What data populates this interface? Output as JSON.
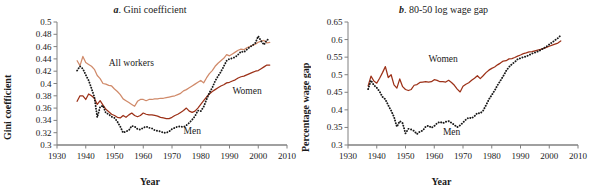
{
  "figure": {
    "width": 591,
    "height": 195,
    "background": "#ffffff"
  },
  "colors": {
    "all_workers": "#D08A6A",
    "women": "#9C3118",
    "men": "#1a1a1a",
    "axis": "#808080",
    "text": "#1a1a1a"
  },
  "panels": {
    "a": {
      "title_letter": "a",
      "title_text": ". Gini coefficient",
      "ylabel": "Gini coefficient",
      "xlabel": "Year"
    },
    "b": {
      "title_letter": "b",
      "title_text": ". 80-50 log wage gap",
      "ylabel": "Percentage wage gap",
      "xlabel": "Year"
    }
  },
  "chart_data": [
    {
      "type": "line",
      "id": "panel-a",
      "title": "a. Gini coefficient",
      "xlabel": "Year",
      "ylabel": "Gini coefficient",
      "xlim": [
        1930,
        2010
      ],
      "ylim": [
        0.3,
        0.5
      ],
      "xticks": [
        1930,
        1940,
        1950,
        1960,
        1970,
        1980,
        1990,
        2000,
        2010
      ],
      "yticks": [
        0.3,
        0.32,
        0.34,
        0.36,
        0.38,
        0.4,
        0.42,
        0.44,
        0.46,
        0.48,
        0.5
      ],
      "ytick_labels": [
        "0.3",
        "0.32",
        "0.34",
        "0.36",
        "0.38",
        "0.4",
        "0.42",
        "0.44",
        "0.46",
        "0.48",
        "0.5"
      ],
      "grid": false,
      "legend": "inline-annotations",
      "annotations": [
        {
          "text": "All workers",
          "x": 1948,
          "y": 0.428
        },
        {
          "text": "Women",
          "x": 1991,
          "y": 0.383
        },
        {
          "text": "Men",
          "x": 1974,
          "y": 0.318
        }
      ],
      "series": [
        {
          "name": "All workers",
          "color": "#D08A6A",
          "style": "solid",
          "x": [
            1937,
            1938,
            1939,
            1940,
            1941,
            1942,
            1943,
            1944,
            1945,
            1946,
            1947,
            1948,
            1949,
            1950,
            1951,
            1952,
            1953,
            1954,
            1955,
            1956,
            1957,
            1958,
            1959,
            1960,
            1961,
            1962,
            1963,
            1964,
            1965,
            1966,
            1967,
            1968,
            1969,
            1970,
            1971,
            1972,
            1973,
            1974,
            1975,
            1976,
            1977,
            1978,
            1979,
            1980,
            1981,
            1982,
            1983,
            1984,
            1985,
            1986,
            1987,
            1988,
            1989,
            1990,
            1991,
            1992,
            1993,
            1994,
            1995,
            1996,
            1997,
            1998,
            1999,
            2000,
            2001,
            2002,
            2003,
            2004
          ],
          "values": [
            0.437,
            0.429,
            0.444,
            0.434,
            0.431,
            0.428,
            0.423,
            0.413,
            0.408,
            0.4,
            0.399,
            0.397,
            0.396,
            0.391,
            0.387,
            0.382,
            0.375,
            0.372,
            0.369,
            0.366,
            0.363,
            0.371,
            0.374,
            0.374,
            0.372,
            0.374,
            0.374,
            0.375,
            0.375,
            0.376,
            0.376,
            0.377,
            0.378,
            0.379,
            0.38,
            0.382,
            0.384,
            0.388,
            0.39,
            0.393,
            0.396,
            0.399,
            0.402,
            0.405,
            0.401,
            0.409,
            0.416,
            0.421,
            0.428,
            0.433,
            0.437,
            0.441,
            0.447,
            0.445,
            0.448,
            0.451,
            0.454,
            0.456,
            0.455,
            0.458,
            0.46,
            0.462,
            0.464,
            0.467,
            0.469,
            0.47,
            0.466,
            0.467
          ]
        },
        {
          "name": "Women",
          "color": "#9C3118",
          "style": "solid",
          "x": [
            1937,
            1938,
            1939,
            1940,
            1941,
            1942,
            1943,
            1944,
            1945,
            1946,
            1947,
            1948,
            1949,
            1950,
            1951,
            1952,
            1953,
            1954,
            1955,
            1956,
            1957,
            1958,
            1959,
            1960,
            1961,
            1962,
            1963,
            1964,
            1965,
            1966,
            1967,
            1968,
            1969,
            1970,
            1971,
            1972,
            1973,
            1974,
            1975,
            1976,
            1977,
            1978,
            1979,
            1980,
            1981,
            1982,
            1983,
            1984,
            1985,
            1986,
            1987,
            1988,
            1989,
            1990,
            1991,
            1992,
            1993,
            1994,
            1995,
            1996,
            1997,
            1998,
            1999,
            2000,
            2001,
            2002,
            2003,
            2004
          ],
          "values": [
            0.371,
            0.38,
            0.38,
            0.374,
            0.383,
            0.38,
            0.376,
            0.366,
            0.372,
            0.365,
            0.358,
            0.354,
            0.35,
            0.348,
            0.345,
            0.344,
            0.348,
            0.345,
            0.349,
            0.352,
            0.348,
            0.346,
            0.348,
            0.352,
            0.35,
            0.349,
            0.349,
            0.348,
            0.347,
            0.345,
            0.344,
            0.343,
            0.343,
            0.345,
            0.348,
            0.35,
            0.353,
            0.356,
            0.36,
            0.355,
            0.353,
            0.355,
            0.36,
            0.366,
            0.372,
            0.378,
            0.383,
            0.387,
            0.39,
            0.393,
            0.396,
            0.398,
            0.401,
            0.402,
            0.404,
            0.406,
            0.409,
            0.411,
            0.412,
            0.414,
            0.416,
            0.418,
            0.42,
            0.421,
            0.424,
            0.427,
            0.43,
            0.43
          ]
        },
        {
          "name": "Men",
          "color": "#1a1a1a",
          "style": "dotted",
          "x": [
            1937,
            1938,
            1939,
            1940,
            1941,
            1942,
            1943,
            1944,
            1945,
            1946,
            1947,
            1948,
            1949,
            1950,
            1951,
            1952,
            1953,
            1954,
            1955,
            1956,
            1957,
            1958,
            1959,
            1960,
            1961,
            1962,
            1963,
            1964,
            1965,
            1966,
            1967,
            1968,
            1969,
            1970,
            1971,
            1972,
            1973,
            1974,
            1975,
            1976,
            1977,
            1978,
            1979,
            1980,
            1981,
            1982,
            1983,
            1984,
            1985,
            1986,
            1987,
            1988,
            1989,
            1990,
            1991,
            1992,
            1993,
            1994,
            1995,
            1996,
            1997,
            1998,
            1999,
            2000,
            2001,
            2002,
            2003,
            2004
          ],
          "values": [
            0.421,
            0.428,
            0.424,
            0.414,
            0.405,
            0.392,
            0.378,
            0.345,
            0.362,
            0.364,
            0.352,
            0.35,
            0.346,
            0.344,
            0.338,
            0.33,
            0.32,
            0.322,
            0.324,
            0.331,
            0.33,
            0.326,
            0.325,
            0.328,
            0.33,
            0.328,
            0.327,
            0.324,
            0.323,
            0.322,
            0.32,
            0.32,
            0.322,
            0.326,
            0.328,
            0.33,
            0.33,
            0.329,
            0.332,
            0.336,
            0.341,
            0.347,
            0.356,
            0.355,
            0.362,
            0.374,
            0.385,
            0.393,
            0.404,
            0.412,
            0.419,
            0.428,
            0.437,
            0.44,
            0.441,
            0.443,
            0.447,
            0.452,
            0.451,
            0.455,
            0.459,
            0.462,
            0.466,
            0.477,
            0.469,
            0.463,
            0.471,
            0.472
          ]
        }
      ]
    },
    {
      "type": "line",
      "id": "panel-b",
      "title": "b. 80-50 log wage gap",
      "xlabel": "Year",
      "ylabel": "Percentage wage gap",
      "xlim": [
        1930,
        2010
      ],
      "ylim": [
        0.3,
        0.65
      ],
      "xticks": [
        1930,
        1940,
        1950,
        1960,
        1970,
        1980,
        1990,
        2000,
        2010
      ],
      "yticks": [
        0.3,
        0.35,
        0.4,
        0.45,
        0.5,
        0.55,
        0.6,
        0.65
      ],
      "ytick_labels": [
        "0.3",
        "0.35",
        "0.4",
        "0.45",
        "0.5",
        "0.55",
        "0.6",
        "0.65"
      ],
      "grid": false,
      "legend": "inline-annotations",
      "annotations": [
        {
          "text": "Women",
          "x": 1958,
          "y": 0.535
        },
        {
          "text": "Men",
          "x": 1963,
          "y": 0.329
        }
      ],
      "series": [
        {
          "name": "Women",
          "color": "#9C3118",
          "style": "solid",
          "x": [
            1937,
            1938,
            1939,
            1940,
            1941,
            1942,
            1943,
            1944,
            1945,
            1946,
            1947,
            1948,
            1949,
            1950,
            1951,
            1952,
            1953,
            1954,
            1955,
            1956,
            1957,
            1958,
            1959,
            1960,
            1961,
            1962,
            1963,
            1964,
            1965,
            1966,
            1967,
            1968,
            1969,
            1970,
            1971,
            1972,
            1973,
            1974,
            1975,
            1976,
            1977,
            1978,
            1979,
            1980,
            1981,
            1982,
            1983,
            1984,
            1985,
            1986,
            1987,
            1988,
            1989,
            1990,
            1991,
            1992,
            1993,
            1994,
            1995,
            1996,
            1997,
            1998,
            1999,
            2000,
            2001,
            2002,
            2003,
            2004
          ],
          "values": [
            0.468,
            0.496,
            0.482,
            0.476,
            0.49,
            0.506,
            0.523,
            0.492,
            0.5,
            0.471,
            0.462,
            0.488,
            0.466,
            0.458,
            0.455,
            0.458,
            0.47,
            0.472,
            0.478,
            0.479,
            0.48,
            0.479,
            0.48,
            0.486,
            0.484,
            0.48,
            0.48,
            0.479,
            0.484,
            0.478,
            0.47,
            0.459,
            0.451,
            0.467,
            0.473,
            0.477,
            0.484,
            0.49,
            0.497,
            0.489,
            0.497,
            0.506,
            0.513,
            0.518,
            0.522,
            0.528,
            0.533,
            0.539,
            0.54,
            0.545,
            0.546,
            0.549,
            0.553,
            0.556,
            0.56,
            0.562,
            0.565,
            0.566,
            0.568,
            0.57,
            0.572,
            0.575,
            0.578,
            0.581,
            0.584,
            0.587,
            0.59,
            0.596
          ]
        },
        {
          "name": "Men",
          "color": "#1a1a1a",
          "style": "dotted",
          "x": [
            1937,
            1938,
            1939,
            1940,
            1941,
            1942,
            1943,
            1944,
            1945,
            1946,
            1947,
            1948,
            1949,
            1950,
            1951,
            1952,
            1953,
            1954,
            1955,
            1956,
            1957,
            1958,
            1959,
            1960,
            1961,
            1962,
            1963,
            1964,
            1965,
            1966,
            1967,
            1968,
            1969,
            1970,
            1971,
            1972,
            1973,
            1974,
            1975,
            1976,
            1977,
            1978,
            1979,
            1980,
            1981,
            1982,
            1983,
            1984,
            1985,
            1986,
            1987,
            1988,
            1989,
            1990,
            1991,
            1992,
            1993,
            1994,
            1995,
            1996,
            1997,
            1998,
            1999,
            2000,
            2001,
            2002,
            2003,
            2004
          ],
          "values": [
            0.459,
            0.484,
            0.47,
            0.463,
            0.452,
            0.437,
            0.43,
            0.413,
            0.398,
            0.38,
            0.352,
            0.368,
            0.362,
            0.333,
            0.346,
            0.344,
            0.34,
            0.331,
            0.338,
            0.341,
            0.352,
            0.355,
            0.349,
            0.354,
            0.362,
            0.366,
            0.362,
            0.366,
            0.368,
            0.363,
            0.357,
            0.351,
            0.356,
            0.364,
            0.372,
            0.378,
            0.376,
            0.382,
            0.391,
            0.39,
            0.398,
            0.413,
            0.43,
            0.442,
            0.455,
            0.47,
            0.483,
            0.496,
            0.511,
            0.522,
            0.53,
            0.536,
            0.544,
            0.547,
            0.55,
            0.552,
            0.556,
            0.56,
            0.563,
            0.566,
            0.57,
            0.575,
            0.58,
            0.586,
            0.592,
            0.598,
            0.604,
            0.612
          ]
        }
      ]
    }
  ]
}
